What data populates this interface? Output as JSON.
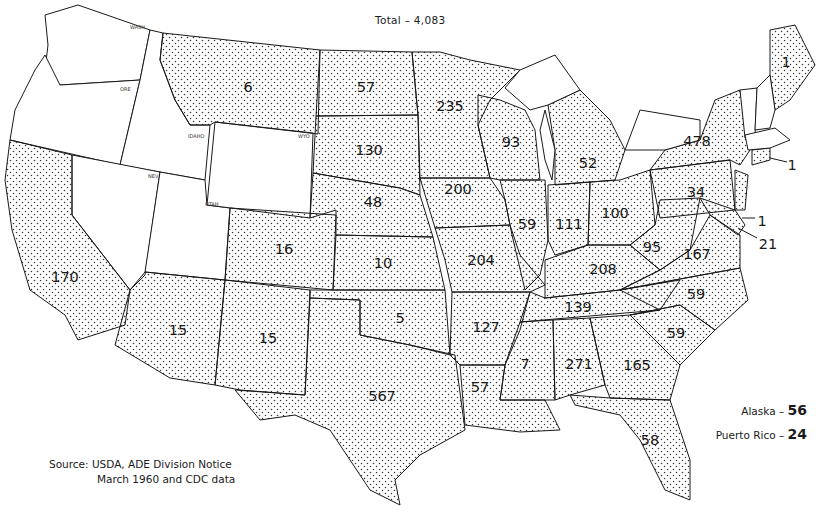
{
  "title": "Total – 4,083",
  "source": {
    "line1": "Source:  USDA, ADE Division Notice",
    "line2": "March   1960  and CDC data"
  },
  "extras": [
    {
      "label": "Alaska – ",
      "value": "56"
    },
    {
      "label": "Puerto Rico – ",
      "value": "24"
    }
  ],
  "legend": {
    "shaded": "state with reported count",
    "unshaded": "no count shown"
  },
  "states": [
    {
      "name": "Washington",
      "abbr": "WASH",
      "value": null,
      "shaded": false
    },
    {
      "name": "Oregon",
      "abbr": "ORE",
      "value": null,
      "shaded": false
    },
    {
      "name": "Idaho",
      "abbr": "IDAHO",
      "value": null,
      "shaded": false
    },
    {
      "name": "Nevada",
      "abbr": "NEV",
      "value": null,
      "shaded": false
    },
    {
      "name": "Utah",
      "abbr": "UTAH",
      "value": null,
      "shaded": false
    },
    {
      "name": "Wyoming",
      "abbr": "WYO",
      "value": null,
      "shaded": false
    },
    {
      "name": "Vermont",
      "abbr": "VT",
      "value": null,
      "shaded": false
    },
    {
      "name": "New Hampshire",
      "abbr": "NH",
      "value": null,
      "shaded": false
    },
    {
      "name": "Massachusetts",
      "abbr": "MASS",
      "value": null,
      "shaded": false
    },
    {
      "name": "California",
      "abbr": "CAL",
      "value": "170",
      "shaded": true
    },
    {
      "name": "Montana",
      "abbr": "MONT",
      "value": "6",
      "shaded": true
    },
    {
      "name": "North Dakota",
      "abbr": "N DAK",
      "value": "57",
      "shaded": true
    },
    {
      "name": "South Dakota",
      "abbr": "S DAK",
      "value": "130",
      "shaded": true
    },
    {
      "name": "Nebraska",
      "abbr": "NEB",
      "value": "48",
      "shaded": true
    },
    {
      "name": "Colorado",
      "abbr": "COL",
      "value": "16",
      "shaded": true
    },
    {
      "name": "Kansas",
      "abbr": "KAN",
      "value": "10",
      "shaded": true
    },
    {
      "name": "Arizona",
      "abbr": "ARIZ",
      "value": "15",
      "shaded": true
    },
    {
      "name": "New Mexico",
      "abbr": "N MEX",
      "value": "15",
      "shaded": true
    },
    {
      "name": "Oklahoma",
      "abbr": "OKLA",
      "value": "5",
      "shaded": true
    },
    {
      "name": "Texas",
      "abbr": "TEXAS",
      "value": "567",
      "shaded": true
    },
    {
      "name": "Minnesota",
      "abbr": "MINN",
      "value": "235",
      "shaded": true
    },
    {
      "name": "Iowa",
      "abbr": "IOWA",
      "value": "200",
      "shaded": true
    },
    {
      "name": "Missouri",
      "abbr": "MO",
      "value": "204",
      "shaded": true
    },
    {
      "name": "Arkansas",
      "abbr": "ARK",
      "value": "127",
      "shaded": true
    },
    {
      "name": "Louisiana",
      "abbr": "LA",
      "value": "57",
      "shaded": true
    },
    {
      "name": "Wisconsin",
      "abbr": "WISC",
      "value": "93",
      "shaded": true
    },
    {
      "name": "Illinois",
      "abbr": "ILL",
      "value": "59",
      "shaded": true
    },
    {
      "name": "Michigan",
      "abbr": "MICH",
      "value": "52",
      "shaded": true
    },
    {
      "name": "Indiana",
      "abbr": "IND",
      "value": "111",
      "shaded": true
    },
    {
      "name": "Ohio",
      "abbr": "OHIO",
      "value": "100",
      "shaded": true
    },
    {
      "name": "Kentucky",
      "abbr": "KY",
      "value": "208",
      "shaded": true
    },
    {
      "name": "Tennessee",
      "abbr": "TENN",
      "value": "139",
      "shaded": true
    },
    {
      "name": "Mississippi",
      "abbr": "MISS",
      "value": "7",
      "shaded": true
    },
    {
      "name": "Alabama",
      "abbr": "ALA",
      "value": "271",
      "shaded": true
    },
    {
      "name": "Georgia",
      "abbr": "GA",
      "value": "165",
      "shaded": true
    },
    {
      "name": "Florida",
      "abbr": "FLA",
      "value": "58",
      "shaded": true
    },
    {
      "name": "South Carolina",
      "abbr": "S CAR",
      "value": "59",
      "shaded": true
    },
    {
      "name": "North Carolina",
      "abbr": "N CAR",
      "value": "59",
      "shaded": true
    },
    {
      "name": "Virginia",
      "abbr": "VA",
      "value": "167",
      "shaded": true
    },
    {
      "name": "West Virginia",
      "abbr": "W VA",
      "value": "95",
      "shaded": true
    },
    {
      "name": "Pennsylvania",
      "abbr": "PA",
      "value": "34",
      "shaded": true
    },
    {
      "name": "New York",
      "abbr": "N Y",
      "value": "478",
      "shaded": true
    },
    {
      "name": "Maine",
      "abbr": "ME",
      "value": "1",
      "shaded": true
    },
    {
      "name": "Connecticut",
      "abbr": "CONN",
      "value": "1",
      "shaded": true
    },
    {
      "name": "New Jersey",
      "abbr": "N J",
      "value": null,
      "shaded": true
    },
    {
      "name": "Delaware",
      "abbr": "DEL",
      "value": "1",
      "shaded": true
    },
    {
      "name": "Maryland",
      "abbr": "MD",
      "value": "21",
      "shaded": true
    }
  ],
  "labels": {
    "california": "170",
    "montana": "6",
    "north_dakota": "57",
    "south_dakota": "130",
    "nebraska": "48",
    "colorado": "16",
    "kansas": "10",
    "arizona": "15",
    "new_mexico": "15",
    "oklahoma": "5",
    "texas": "567",
    "minnesota": "235",
    "iowa": "200",
    "missouri": "204",
    "arkansas": "127",
    "louisiana": "57",
    "wisconsin": "93",
    "illinois": "59",
    "michigan": "52",
    "indiana": "111",
    "ohio": "100",
    "kentucky": "208",
    "tennessee": "139",
    "mississippi": "7",
    "alabama": "271",
    "georgia": "165",
    "florida": "58",
    "south_carolina": "59",
    "north_carolina": "59",
    "virginia": "167",
    "west_virginia": "95",
    "pennsylvania": "34",
    "new_york": "478",
    "maine": "1",
    "connecticut": "1",
    "delaware": "1",
    "maryland": "21"
  },
  "colors": {
    "line": "#1a1a1a",
    "dot": "#333333",
    "background": "#ffffff"
  }
}
